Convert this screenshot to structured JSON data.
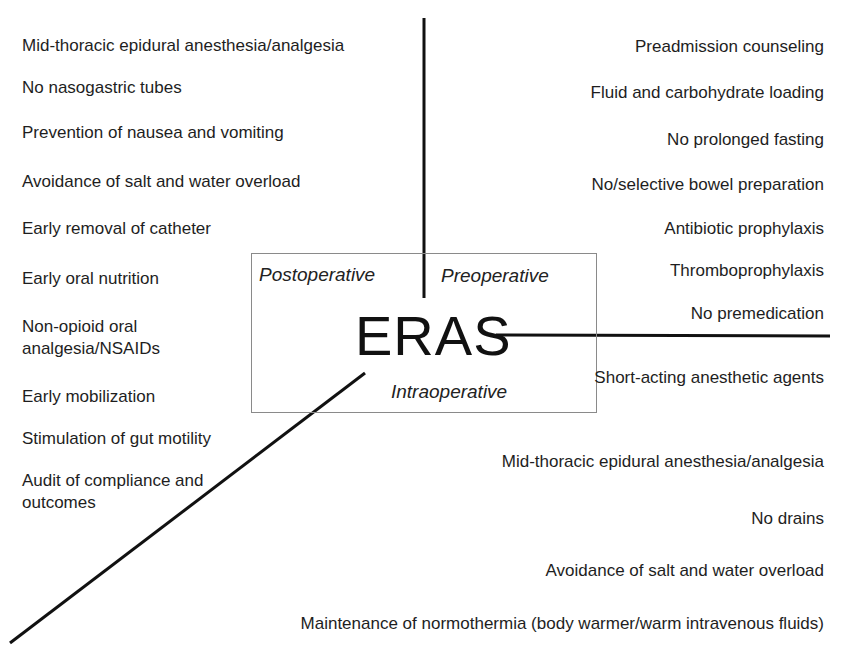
{
  "diagram": {
    "center_label": "ERAS",
    "phases": {
      "postoperative": "Postoperative",
      "preoperative": "Preoperative",
      "intraoperative": "Intraoperative"
    },
    "postoperative_items": [
      "Mid-thoracic epidural anesthesia/analgesia",
      "No nasogastric tubes",
      "Prevention of nausea and vomiting",
      "Avoidance of salt and water overload",
      "Early removal of catheter",
      "Early oral nutrition",
      "Non-opioid oral analgesia/NSAIDs",
      "Early mobilization",
      "Stimulation of gut motility",
      "Audit of compliance and outcomes"
    ],
    "preoperative_items": [
      "Preadmission counseling",
      "Fluid and carbohydrate loading",
      "No prolonged fasting",
      "No/selective bowel preparation",
      "Antibiotic prophylaxis",
      "Thromboprophylaxis",
      "No premedication"
    ],
    "intraoperative_items": [
      "Short-acting anesthetic agents",
      "Mid-thoracic epidural anesthesia/analgesia",
      "No drains",
      "Avoidance of salt and water overload",
      "Maintenance of normothermia (body warmer/warm intravenous fluids)"
    ]
  }
}
